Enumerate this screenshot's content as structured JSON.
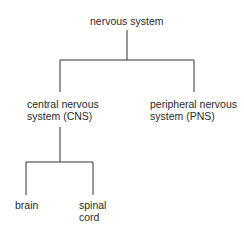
{
  "diagram": {
    "type": "tree",
    "root": {
      "label": "nervous system",
      "children": [
        {
          "label_line1": "central nervous",
          "label_line2": "system (CNS)",
          "children": [
            {
              "label": "brain"
            },
            {
              "label_line1": "spinal",
              "label_line2": "cord"
            }
          ]
        },
        {
          "label_line1": "peripheral nervous",
          "label_line2": "system (PNS)"
        }
      ]
    }
  },
  "colors": {
    "line": "#333333",
    "text": "#2a2a2a",
    "background": "#ffffff"
  }
}
